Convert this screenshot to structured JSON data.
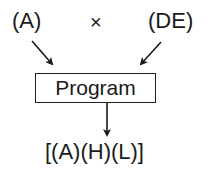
{
  "inputs": {
    "left": "(A)",
    "operator": "×",
    "right": "(DE)"
  },
  "process": {
    "label": "Program"
  },
  "output": {
    "label": "[(A)(H)(L)]"
  }
}
